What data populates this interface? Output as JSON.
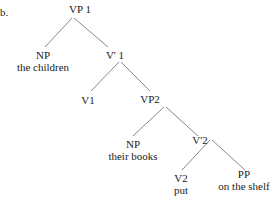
{
  "example_marker": "b.",
  "tree": {
    "nodes": [
      {
        "id": "vp1",
        "label": "VP 1",
        "text": "",
        "x": 72,
        "y": 3
      },
      {
        "id": "np1",
        "label": "NP",
        "text": "the children",
        "x": 43,
        "y": 50
      },
      {
        "id": "vbar1",
        "label": "V' 1",
        "text": "",
        "x": 111,
        "y": 50
      },
      {
        "id": "v1",
        "label": "V1",
        "text": "",
        "x": 88,
        "y": 94
      },
      {
        "id": "vp2",
        "label": "VP2",
        "text": "",
        "x": 148,
        "y": 94
      },
      {
        "id": "np2",
        "label": "NP",
        "text": "their books",
        "x": 130,
        "y": 139
      },
      {
        "id": "vbar2",
        "label": "V'2",
        "text": "",
        "x": 199,
        "y": 139
      },
      {
        "id": "v2",
        "label": "V2",
        "text": "put",
        "x": 180,
        "y": 174
      },
      {
        "id": "pp",
        "label": "PP",
        "text": "on the shelf",
        "x": 243,
        "y": 174
      }
    ],
    "edges": [
      [
        "vp1",
        "np1"
      ],
      [
        "vp1",
        "vbar1"
      ],
      [
        "vbar1",
        "v1"
      ],
      [
        "vbar1",
        "vp2"
      ],
      [
        "vp2",
        "np2"
      ],
      [
        "vp2",
        "vbar2"
      ],
      [
        "vbar2",
        "v2"
      ],
      [
        "vbar2",
        "pp"
      ]
    ]
  }
}
